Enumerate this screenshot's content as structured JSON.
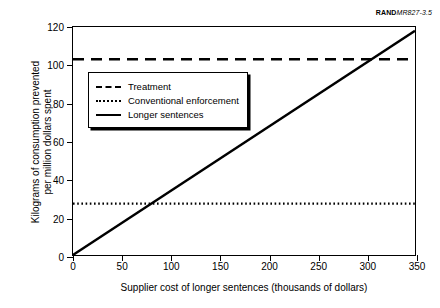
{
  "credit": {
    "brand": "RAND",
    "document": "MR827-3.5"
  },
  "chart_data": {
    "type": "line",
    "title": "",
    "xlabel": "Supplier cost of longer sentences (thousands of dollars)",
    "ylabel_line1": "Kilograms of consumption prevented",
    "ylabel_line2": "per million dollars spent",
    "xlim": [
      0,
      350
    ],
    "ylim": [
      0,
      120
    ],
    "xticks": [
      0,
      50,
      100,
      150,
      200,
      250,
      300,
      350
    ],
    "yticks": [
      0,
      20,
      40,
      60,
      80,
      100,
      120
    ],
    "grid": false,
    "legend_position": "upper left",
    "series": [
      {
        "name": "Treatment",
        "style": "dashed",
        "color": "#000000",
        "x": [
          0,
          350
        ],
        "values": [
          103,
          103
        ]
      },
      {
        "name": "Conventional enforcement",
        "style": "dotted",
        "color": "#000000",
        "x": [
          0,
          350
        ],
        "values": [
          27,
          27
        ]
      },
      {
        "name": "Longer sentences",
        "style": "solid",
        "color": "#000000",
        "x": [
          0,
          350
        ],
        "values": [
          0,
          118
        ]
      }
    ],
    "annotations": [
      "Longer sentences crosses Conventional enforcement near x = 82",
      "Longer sentences crosses Treatment near x = 307"
    ]
  }
}
